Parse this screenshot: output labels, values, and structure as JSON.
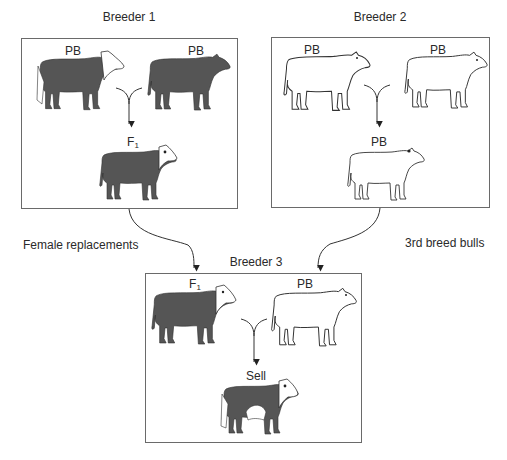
{
  "breeders": [
    {
      "title": "Breeder 1",
      "parents": [
        {
          "label": "PB",
          "pattern": "dark-white-face"
        },
        {
          "label": "PB",
          "pattern": "dark-solid"
        }
      ],
      "offspring": {
        "label": "F",
        "sub": "1",
        "pattern": "dark-white-face"
      }
    },
    {
      "title": "Breeder 2",
      "parents": [
        {
          "label": "PB",
          "pattern": "white-outline-bull"
        },
        {
          "label": "PB",
          "pattern": "white-outline-cow"
        }
      ],
      "offspring": {
        "label": "PB",
        "sub": "",
        "pattern": "white-outline"
      }
    },
    {
      "title": "Breeder 3",
      "parents": [
        {
          "label": "F",
          "sub": "1",
          "pattern": "dark-white-face"
        },
        {
          "label": "PB",
          "pattern": "white-outline-bull"
        }
      ],
      "offspring": {
        "label": "Sell",
        "sub": "",
        "pattern": "dark-white-face-belted"
      }
    }
  ],
  "flows": {
    "left": "Female replacements",
    "right": "3rd breed bulls"
  },
  "colors": {
    "dark_cattle": "#555555",
    "outline": "#333333",
    "box_border": "#6a6a6a"
  }
}
